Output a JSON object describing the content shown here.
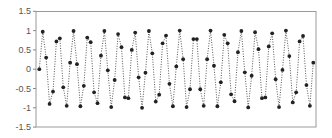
{
  "chart_data": {
    "type": "line",
    "title": "",
    "xlabel": "",
    "ylabel": "",
    "ylim": [
      -1.5,
      1.5
    ],
    "yticks": [
      1.5,
      1,
      0.5,
      0,
      -0.5,
      -1,
      -1.5
    ],
    "ytick_labels": [
      "1.5",
      "1",
      "0.5",
      "0",
      "-0.5",
      "-1",
      "-1.5"
    ],
    "xticks_visible": false,
    "grid": false,
    "legend": null,
    "line_style": "dotted",
    "marker": "circle",
    "series": [
      {
        "name": "series-1",
        "values": [
          0.0,
          0.97,
          0.3,
          -0.9,
          -0.58,
          0.72,
          0.8,
          -0.47,
          -0.95,
          0.17,
          0.99,
          0.13,
          -0.96,
          -0.43,
          0.82,
          0.7,
          -0.6,
          -0.88,
          0.35,
          0.99,
          -0.03,
          -0.98,
          -0.28,
          0.91,
          0.57,
          -0.73,
          -0.75,
          0.5,
          0.95,
          -0.21,
          -1.0,
          -0.09,
          0.99,
          0.41,
          -0.84,
          -0.66,
          0.67,
          0.87,
          -0.38,
          -0.96,
          0.07,
          1.0,
          0.26,
          -0.98,
          -0.52,
          0.78,
          0.78,
          -0.52,
          -0.95,
          0.26,
          1.0,
          0.09,
          -0.96,
          -0.34,
          0.89,
          0.67,
          -0.65,
          -0.83,
          0.44,
          0.99,
          -0.08,
          -0.99,
          -0.17,
          0.96,
          0.52,
          -0.75,
          -0.73,
          0.59,
          0.93,
          -0.26,
          -0.98,
          -0.02,
          1.0,
          0.34,
          -0.86,
          -0.6,
          0.72,
          0.86,
          -0.41,
          -0.95,
          0.17
        ]
      }
    ],
    "colors": {
      "marker": "#222222",
      "line": "#555555",
      "frame": "#9a9a9a",
      "axis": "#888888",
      "label": "#555555"
    }
  }
}
